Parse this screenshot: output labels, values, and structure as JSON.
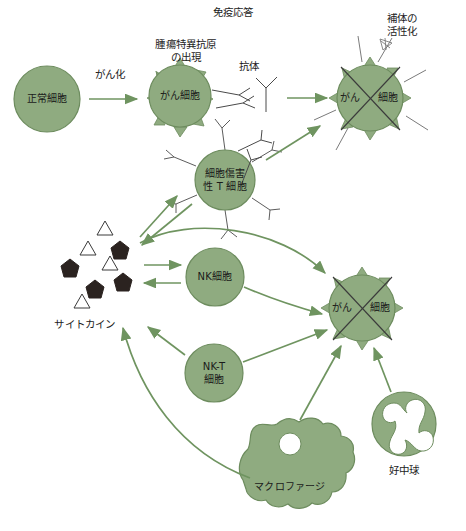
{
  "diagram": {
    "title": "免疫応答",
    "width": 466,
    "height": 531,
    "background": "#ffffff",
    "colors": {
      "cell_fill": "#8fab80",
      "cell_stroke": "#6d8c5e",
      "arrow": "#6f9460",
      "antibody_line": "#4a4a4a",
      "text": "#1c1c1c",
      "cytokine_dark": "#2b2320",
      "cytokine_light": "#ffffff",
      "cross_line": "#3b3b3b"
    }
  },
  "annotations": {
    "immune_response": "免疫応答",
    "tumor_antigen": "腫瘍特異抗原\nの出現",
    "antibody": "抗体",
    "complement": "補体の\n活性化",
    "canceration": "がん化",
    "cytokine": "サイトカイン",
    "neutrophil": "好中球",
    "macrophage": "マクロファージ"
  },
  "cells": {
    "normal_cell": {
      "label": "正常細胞",
      "cx": 47,
      "cy": 99,
      "r": 33
    },
    "cancer_cell": {
      "label": "がん細胞",
      "cx": 180,
      "cy": 96,
      "r": 31
    },
    "killed_cancer_top": {
      "label_left": "がん",
      "label_right": "細胞",
      "cx": 370,
      "cy": 98,
      "r": 33
    },
    "cytotoxic_t_cell": {
      "label": "細胞傷害\n性 T 細胞",
      "cx": 225,
      "cy": 180,
      "r": 30
    },
    "nk_cell": {
      "label": "NK細胞",
      "cx": 215,
      "cy": 277,
      "r": 29
    },
    "nkt_cell": {
      "label": "NK-T\n細胞",
      "cx": 214,
      "cy": 373,
      "r": 29
    },
    "killed_cancer_bottom": {
      "label_left": "がん",
      "label_right": "細胞",
      "cx": 362,
      "cy": 308,
      "r": 33
    },
    "macrophage": {
      "label": "マクロファージ",
      "cx": 290,
      "cy": 467
    },
    "neutrophil": {
      "label": "好中球",
      "cx": 404,
      "cy": 424,
      "r": 32
    }
  },
  "cytokines": {
    "triangles": [
      {
        "x": 105,
        "y": 228
      },
      {
        "x": 88,
        "y": 248
      },
      {
        "x": 110,
        "y": 263
      },
      {
        "x": 82,
        "y": 301
      }
    ],
    "pentagons": [
      {
        "x": 120,
        "y": 250
      },
      {
        "x": 70,
        "y": 268
      },
      {
        "x": 95,
        "y": 289
      },
      {
        "x": 123,
        "y": 282
      }
    ]
  },
  "flows": [
    {
      "from": "normal_cell",
      "to": "cancer_cell",
      "label": "がん化"
    },
    {
      "from": "antibody",
      "to": "killed_cancer_top",
      "label": ""
    },
    {
      "from": "cytotoxic_t_cell",
      "to": "killed_cancer_top",
      "label": ""
    },
    {
      "from": "cytokines",
      "to": "cytotoxic_t_cell",
      "label": ""
    },
    {
      "from": "cytotoxic_t_cell",
      "to": "cytokines",
      "label": ""
    },
    {
      "from": "cytokines",
      "to": "nk_cell",
      "label": ""
    },
    {
      "from": "nk_cell",
      "to": "cytokines",
      "label": ""
    },
    {
      "from": "cytokines",
      "to": "killed_cancer_bottom",
      "label": ""
    },
    {
      "from": "nk_cell",
      "to": "killed_cancer_bottom",
      "label": ""
    },
    {
      "from": "nkt_cell",
      "to": "killed_cancer_bottom",
      "label": ""
    },
    {
      "from": "nkt_cell",
      "to": "cytokines",
      "label": ""
    },
    {
      "from": "macrophage",
      "to": "cytokines",
      "label": ""
    },
    {
      "from": "macrophage",
      "to": "killed_cancer_bottom",
      "label": ""
    },
    {
      "from": "neutrophil",
      "to": "killed_cancer_bottom",
      "label": ""
    }
  ]
}
